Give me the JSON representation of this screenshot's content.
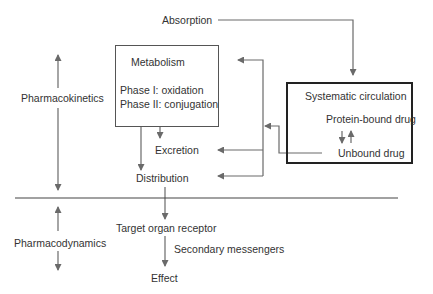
{
  "diagram": {
    "sections": {
      "pharmacokinetics": "Pharmacokinetics",
      "pharmacodynamics": "Pharmacodynamics"
    },
    "nodes": {
      "absorption": "Absorption",
      "metabolism_title": "Metabolism",
      "phase1": "Phase I: oxidation",
      "phase2": "Phase II: conjugation",
      "systemic_title": "Systematic circulation",
      "protein_bound": "Protein-bound drug",
      "unbound": "Unbound drug",
      "excretion": "Excretion",
      "distribution": "Distribution",
      "target": "Target organ receptor",
      "secondary": "Secondary messengers",
      "effect": "Effect"
    },
    "edges": [
      {
        "from": "Absorption",
        "to": "Systematic circulation"
      },
      {
        "from": "Unbound drug",
        "to": "Metabolism"
      },
      {
        "from": "Unbound drug",
        "to": "Excretion"
      },
      {
        "from": "Unbound drug",
        "to": "Distribution"
      },
      {
        "from": "Metabolism",
        "to": "Excretion"
      },
      {
        "from": "Metabolism",
        "to": "Distribution"
      },
      {
        "from": "Protein-bound drug",
        "to": "Unbound drug",
        "bidirectional": true
      },
      {
        "from": "Distribution",
        "to": "Target organ receptor"
      },
      {
        "from": "Target organ receptor",
        "to": "Effect",
        "label": "Secondary messengers"
      }
    ],
    "colors": {
      "line": "#6a6a6a",
      "box_border": "#555555",
      "systemic_border": "#222222",
      "text": "#333333"
    }
  }
}
